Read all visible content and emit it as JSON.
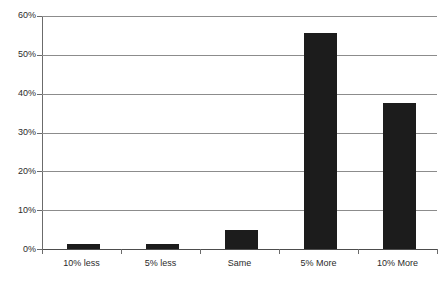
{
  "chart_data": {
    "type": "bar",
    "title": "",
    "xlabel": "",
    "ylabel": "",
    "categories": [
      "10% less",
      "5% less",
      "Same",
      "5% More",
      "10% More"
    ],
    "values": [
      1.3,
      1.3,
      5.0,
      55.5,
      37.5
    ],
    "ylim": [
      0,
      60
    ],
    "ytick_values": [
      0,
      10,
      20,
      30,
      40,
      50,
      60
    ],
    "ytick_labels": [
      "0%",
      "10%",
      "20%",
      "30%",
      "40%",
      "50%",
      "60%"
    ],
    "grid": true,
    "legend": "none",
    "bar_color": "#1c1c1c",
    "gridline_color": "#8c8c8c",
    "axis_color": "#6b6b6b",
    "background_color": "#ffffff"
  }
}
